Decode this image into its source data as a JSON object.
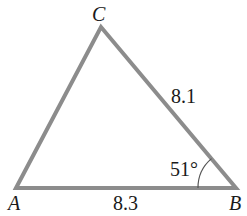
{
  "diagram": {
    "type": "triangle",
    "vertices": {
      "A": {
        "label": "A"
      },
      "B": {
        "label": "B"
      },
      "C": {
        "label": "C"
      }
    },
    "sides": {
      "BC": {
        "label": "8.1"
      },
      "AB": {
        "label": "8.3"
      }
    },
    "angles": {
      "B": {
        "label": "51°"
      }
    },
    "colors": {
      "stroke": "#8c8c8c",
      "text": "#1a1a1a"
    }
  }
}
